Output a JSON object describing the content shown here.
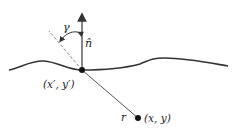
{
  "diagram": {
    "labels": {
      "source_point": "(x′, y′)",
      "field_point": "(x, y)",
      "distance": "r",
      "normal": "n̂",
      "angle": "γ"
    },
    "colors": {
      "stroke": "#333333",
      "dashed": "#888888",
      "text": "#222222"
    }
  }
}
